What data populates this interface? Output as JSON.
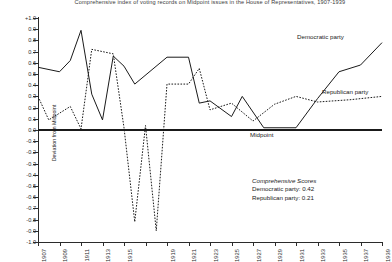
{
  "chart": {
    "title": "Comprehensive index of voting records on Midpoint issues in the House of Representatives, 1907-1939",
    "axis_title_y": "Deviation from Midpoint",
    "midpoint_label": "Midpoint",
    "series_labels": {
      "democratic": "Democratic party",
      "republican": "Republican party"
    },
    "annotation": {
      "heading": "Comprehensive Scores",
      "line1": "Democratic party: 0.42",
      "line2": "Republican party: 0.21"
    }
  },
  "chart_data": {
    "type": "line",
    "title": "Comprehensive index of voting records on Midpoint issues in the House of Representatives, 1907-1939",
    "xlabel": "",
    "ylabel": "Deviation from Midpoint",
    "ylim": [
      -1.0,
      1.0
    ],
    "xlim": [
      1907,
      1939
    ],
    "grid": false,
    "legend": "inline-annotation",
    "reference_line": {
      "value": 0.0,
      "label": "Midpoint",
      "style": "thick-solid"
    },
    "x": [
      1907,
      1908,
      1909,
      1910,
      1911,
      1912,
      1913,
      1914,
      1915,
      1916,
      1917,
      1918,
      1919,
      1920,
      1921,
      1922,
      1923,
      1924,
      1925,
      1926,
      1927,
      1928,
      1929,
      1930,
      1931,
      1932,
      1933,
      1934,
      1935,
      1936,
      1937,
      1938,
      1939
    ],
    "xtick_labels": [
      "1907",
      "",
      "1909",
      "",
      "1911",
      "",
      "1913",
      "",
      "1915",
      "",
      "",
      "",
      "1919",
      "",
      "1921",
      "",
      "1923",
      "",
      "1925",
      "",
      "1927",
      "",
      "1929",
      "",
      "1931",
      "",
      "1933",
      "",
      "1935",
      "",
      "1937",
      "",
      "1939"
    ],
    "ytick_labels": [
      "+1.0",
      "0.9",
      "0.8",
      "0.7",
      "0.6",
      "0.5",
      "0.4",
      "0.3",
      "0.2",
      "0.1",
      "0.0",
      "-0.1",
      "-0.2",
      "-0.3",
      "-0.4",
      "-0.5",
      "-0.6",
      "-0.7",
      "-0.8",
      "-0.9",
      "-1.0"
    ],
    "ytick_values": [
      1.0,
      0.9,
      0.8,
      0.7,
      0.6,
      0.5,
      0.4,
      0.3,
      0.2,
      0.1,
      0.0,
      -0.1,
      -0.2,
      -0.3,
      -0.4,
      -0.5,
      -0.6,
      -0.7,
      -0.8,
      -0.9,
      -1.0
    ],
    "series": [
      {
        "name": "Democratic party",
        "style": "solid",
        "color": "#1a1a1a",
        "points": [
          [
            1907,
            0.56
          ],
          [
            1909,
            0.52
          ],
          [
            1910,
            0.62
          ],
          [
            1911,
            0.89
          ],
          [
            1912,
            0.32
          ],
          [
            1913,
            0.09
          ],
          [
            1914,
            0.66
          ],
          [
            1915,
            0.57
          ],
          [
            1916,
            0.41
          ],
          [
            1919,
            0.65
          ],
          [
            1921,
            0.65
          ],
          [
            1922,
            0.24
          ],
          [
            1923,
            0.26
          ],
          [
            1925,
            0.12
          ],
          [
            1926,
            0.3
          ],
          [
            1928,
            0.02
          ],
          [
            1931,
            0.02
          ],
          [
            1933,
            0.28
          ],
          [
            1935,
            0.52
          ],
          [
            1937,
            0.58
          ],
          [
            1939,
            0.78
          ]
        ]
      },
      {
        "name": "Republican party",
        "style": "dotted",
        "color": "#1a1a1a",
        "points": [
          [
            1907,
            0.3
          ],
          [
            1908,
            0.09
          ],
          [
            1910,
            0.21
          ],
          [
            1911,
            0.01
          ],
          [
            1912,
            0.72
          ],
          [
            1913,
            0.7
          ],
          [
            1914,
            0.68
          ],
          [
            1915,
            0.02
          ],
          [
            1916,
            -0.82
          ],
          [
            1917,
            0.04
          ],
          [
            1918,
            -0.9
          ],
          [
            1919,
            0.41
          ],
          [
            1921,
            0.41
          ],
          [
            1922,
            0.55
          ],
          [
            1923,
            0.18
          ],
          [
            1925,
            0.24
          ],
          [
            1927,
            0.08
          ],
          [
            1929,
            0.23
          ],
          [
            1931,
            0.3
          ],
          [
            1933,
            0.25
          ],
          [
            1936,
            0.27
          ],
          [
            1939,
            0.3
          ]
        ]
      }
    ],
    "scores": {
      "democratic": 0.42,
      "republican": 0.21
    }
  }
}
